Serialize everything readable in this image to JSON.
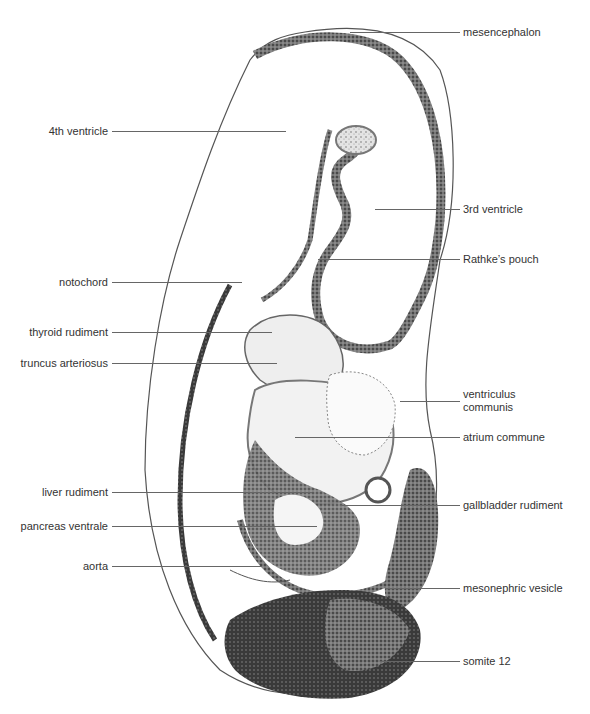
{
  "figure": {
    "labels_left": [
      {
        "id": "4th-ventricle",
        "text": "4th ventricle",
        "y": 131
      },
      {
        "id": "notochord",
        "text": "notochord",
        "y": 282
      },
      {
        "id": "thyroid-rudiment",
        "text": "thyroid rudiment",
        "y": 332
      },
      {
        "id": "truncus-arteriosus",
        "text": "truncus arteriosus",
        "y": 363
      },
      {
        "id": "liver-rudiment",
        "text": "liver rudiment",
        "y": 492
      },
      {
        "id": "pancreas-ventrale",
        "text": "pancreas ventrale",
        "y": 526
      },
      {
        "id": "aorta",
        "text": "aorta",
        "y": 566
      }
    ],
    "labels_right": [
      {
        "id": "mesencephalon",
        "text": "mesencephalon",
        "y": 32
      },
      {
        "id": "3rd-ventricle",
        "text": "3rd ventricle",
        "y": 209
      },
      {
        "id": "rathkes-pouch",
        "text": "Rathke’s pouch",
        "y": 259
      },
      {
        "id": "ventriculus-communis",
        "text": "ventriculus communis",
        "line1": "ventriculus",
        "line2": "communis",
        "y": 401
      },
      {
        "id": "atrium-commune",
        "text": "atrium commune",
        "y": 437
      },
      {
        "id": "gallbladder-rudiment",
        "text": "gallbladder rudiment",
        "y": 505
      },
      {
        "id": "mesonephric-vesicle",
        "text": "mesonephric vesicle",
        "y": 588
      },
      {
        "id": "somite-12",
        "text": "somite 12",
        "y": 661
      }
    ]
  }
}
